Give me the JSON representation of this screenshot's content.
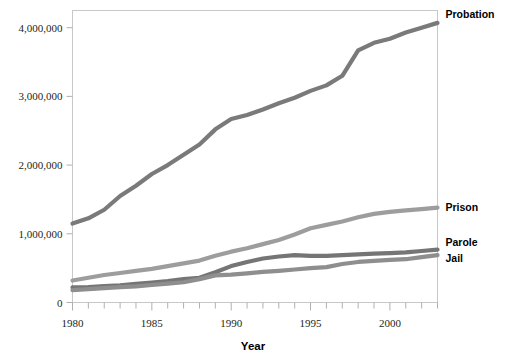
{
  "chart_data": {
    "type": "line",
    "title": "",
    "xlabel": "Year",
    "ylabel": "",
    "xlim": [
      1980,
      2003
    ],
    "ylim": [
      0,
      4250000
    ],
    "grid": false,
    "legend_position": "right-inline",
    "x_ticks_major": [
      "1980",
      "1985",
      "1990",
      "1995",
      "2000"
    ],
    "x_tick_values_major": [
      1980,
      1985,
      1990,
      1995,
      2000
    ],
    "x_ticks_minor_every": 1,
    "y_ticks": [
      "0",
      "1,000,000",
      "2,000,000",
      "3,000,000",
      "4,000,000"
    ],
    "y_tick_values": [
      0,
      1000000,
      2000000,
      3000000,
      4000000
    ],
    "x": [
      1980,
      1981,
      1982,
      1983,
      1984,
      1985,
      1986,
      1987,
      1988,
      1989,
      1990,
      1991,
      1992,
      1993,
      1994,
      1995,
      1996,
      1997,
      1998,
      1999,
      2000,
      2001,
      2002,
      2003
    ],
    "series": [
      {
        "name": "Probation",
        "color": "#7a7a7a",
        "label_x": 1980,
        "values": [
          1150000,
          1225000,
          1350000,
          1550000,
          1700000,
          1870000,
          2000000,
          2150000,
          2300000,
          2520000,
          2670000,
          2730000,
          2810000,
          2900000,
          2980000,
          3080000,
          3160000,
          3300000,
          3670000,
          3780000,
          3840000,
          3930000,
          4000000,
          4070000
        ]
      },
      {
        "name": "Prison",
        "color": "#9d9d9d",
        "label_x": 2003,
        "values": [
          320000,
          360000,
          400000,
          430000,
          460000,
          490000,
          530000,
          570000,
          610000,
          680000,
          740000,
          790000,
          850000,
          910000,
          990000,
          1080000,
          1130000,
          1180000,
          1240000,
          1290000,
          1320000,
          1340000,
          1360000,
          1380000
        ]
      },
      {
        "name": "Parole",
        "color": "#757575",
        "label_x": 2003,
        "values": [
          220000,
          225000,
          240000,
          250000,
          270000,
          290000,
          310000,
          340000,
          360000,
          440000,
          530000,
          590000,
          640000,
          670000,
          690000,
          680000,
          680000,
          690000,
          700000,
          710000,
          720000,
          730000,
          750000,
          770000
        ]
      },
      {
        "name": "Jail",
        "color": "#8e8e8e",
        "label_x": 2003,
        "values": [
          180000,
          195000,
          210000,
          225000,
          235000,
          255000,
          275000,
          295000,
          340000,
          395000,
          405000,
          425000,
          445000,
          460000,
          480000,
          500000,
          515000,
          560000,
          590000,
          605000,
          620000,
          630000,
          660000,
          690000
        ]
      }
    ]
  },
  "axis": {
    "x_title": "Year"
  },
  "labels": {
    "probation": "Probation",
    "prison": "Prison",
    "parole": "Parole",
    "jail": "Jail"
  }
}
